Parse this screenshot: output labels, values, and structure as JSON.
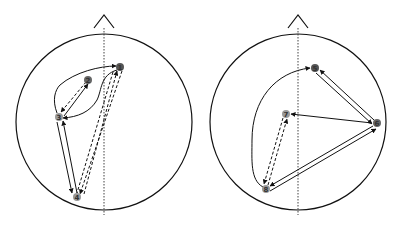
{
  "diagram": {
    "type": "brain-connectivity-head-maps",
    "colors": {
      "stroke": "#111111",
      "node_dark": "#555555",
      "node_light": "#999999",
      "background": "#ffffff"
    },
    "heads": [
      {
        "id": "left",
        "nodes": [
          {
            "id": "1",
            "label": "1",
            "x": 120,
            "y": 67,
            "shade": "dark"
          },
          {
            "id": "2",
            "label": "2",
            "x": 88,
            "y": 80,
            "shade": "dark"
          },
          {
            "id": "3",
            "label": "3",
            "x": 59,
            "y": 117,
            "shade": "light"
          },
          {
            "id": "4",
            "label": "4",
            "x": 77,
            "y": 197,
            "shade": "light"
          }
        ],
        "edges": [
          {
            "from": "3",
            "to": "1",
            "style": "solid",
            "shape": "curve"
          },
          {
            "from": "1",
            "to": "3",
            "style": "solid",
            "shape": "curve"
          },
          {
            "from": "2",
            "to": "3",
            "style": "dashed"
          },
          {
            "from": "3",
            "to": "2",
            "style": "solid"
          },
          {
            "from": "3",
            "to": "4",
            "style": "solid"
          },
          {
            "from": "4",
            "to": "3",
            "style": "solid"
          },
          {
            "from": "1",
            "to": "4",
            "style": "dashed"
          },
          {
            "from": "4",
            "to": "1",
            "style": "dashed"
          }
        ]
      },
      {
        "id": "right",
        "nodes": [
          {
            "id": "5",
            "label": "5",
            "x": 315,
            "y": 68,
            "shade": "dark"
          },
          {
            "id": "6",
            "label": "6",
            "x": 377,
            "y": 123,
            "shade": "dark"
          },
          {
            "id": "7",
            "label": "7",
            "x": 286,
            "y": 114,
            "shade": "light"
          },
          {
            "id": "8",
            "label": "8",
            "x": 266,
            "y": 189,
            "shade": "light"
          }
        ],
        "edges": [
          {
            "from": "8",
            "to": "5",
            "style": "solid",
            "shape": "curve"
          },
          {
            "from": "6",
            "to": "5",
            "style": "solid"
          },
          {
            "from": "5",
            "to": "6",
            "style": "solid"
          },
          {
            "from": "6",
            "to": "7",
            "style": "solid"
          },
          {
            "from": "6",
            "to": "8",
            "style": "solid"
          },
          {
            "from": "8",
            "to": "6",
            "style": "solid"
          },
          {
            "from": "7",
            "to": "8",
            "style": "dashed"
          },
          {
            "from": "8",
            "to": "7",
            "style": "dashed"
          }
        ]
      }
    ]
  }
}
